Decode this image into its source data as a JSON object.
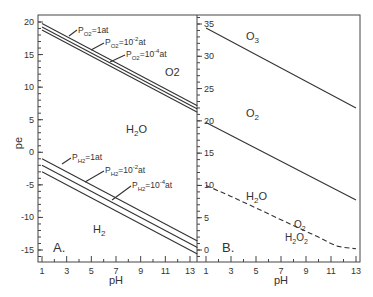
{
  "chart_data": [
    {
      "panel": "A.",
      "type": "line",
      "xlabel": "pH",
      "ylabel": "pe",
      "xlim": [
        0.7,
        13.6
      ],
      "ylim": [
        -16.5,
        21
      ],
      "xticks": [
        1,
        3,
        5,
        7,
        9,
        11,
        13
      ],
      "yticks": [
        20,
        15,
        10,
        5,
        0,
        -5,
        -10,
        -15
      ],
      "grid": false,
      "series": [
        {
          "name": "PO2=1at",
          "x": [
            1,
            13.6
          ],
          "y": [
            19.75,
            7.15
          ]
        },
        {
          "name": "PO2=10^-2at",
          "x": [
            1,
            13.6
          ],
          "y": [
            19.25,
            6.65
          ]
        },
        {
          "name": "PO2=10^-4at",
          "x": [
            1,
            13.6
          ],
          "y": [
            18.75,
            6.15
          ]
        },
        {
          "name": "PH2=1at",
          "x": [
            1,
            13.6
          ],
          "y": [
            -1,
            -13.6
          ]
        },
        {
          "name": "PH2=10^-2at",
          "x": [
            1,
            13.6
          ],
          "y": [
            -2,
            -14.6
          ]
        },
        {
          "name": "PH2=10^-4at",
          "x": [
            1,
            13.6
          ],
          "y": [
            -3,
            -15.6
          ]
        }
      ],
      "annotations": [
        "O2",
        "H2O",
        "H2",
        "A."
      ]
    },
    {
      "panel": "B.",
      "type": "line",
      "xlabel": "pH",
      "ylabel": "",
      "xlim": [
        0.7,
        13.3
      ],
      "ylim": [
        -1.5,
        37
      ],
      "xticks": [
        1,
        3,
        5,
        7,
        9,
        11,
        13
      ],
      "yticks": [
        35,
        30,
        25,
        20,
        15,
        10,
        5,
        0
      ],
      "grid": false,
      "series": [
        {
          "name": "O3/O2",
          "style": "solid",
          "x": [
            1,
            13
          ],
          "y": [
            34.4,
            22.0
          ]
        },
        {
          "name": "O2/H2O",
          "style": "solid",
          "x": [
            1,
            13
          ],
          "y": [
            19.75,
            7.75
          ]
        },
        {
          "name": "O2/H2O2 boundary",
          "style": "dashed",
          "x": [
            1,
            3,
            5,
            7,
            9,
            10,
            11,
            11.5,
            12,
            13
          ],
          "y": [
            10,
            8.3,
            6.5,
            4.7,
            2.9,
            2.0,
            1.0,
            0.6,
            0.4,
            0.2
          ]
        }
      ],
      "annotations": [
        "O3",
        "O2",
        "H2O",
        "O2",
        "H2O2",
        "B."
      ]
    }
  ],
  "labels": {
    "pe": "pe",
    "ph": "pH",
    "panel_a": "A.",
    "panel_b": "B.",
    "o2": "O2",
    "h2o": "H2O",
    "h2": "H2",
    "o3": "O3",
    "h2o2": "H2O2",
    "po2_1": "=1at",
    "po2_2": "=10",
    "po2_4": "=10",
    "ph2_1": "=1at",
    "ph2_2": "=10",
    "ph2_4": "=10",
    "exp_2": "-2",
    "exp_4": "-4",
    "at": "at",
    "p": "P",
    "sub_o2": "O2",
    "sub_h2": "H2"
  },
  "ticks": {
    "a_y": [
      "20",
      "15",
      "10",
      "5",
      "0",
      "-5",
      "-10",
      "-15"
    ],
    "b_y": [
      "35",
      "30",
      "25",
      "20",
      "15",
      "10",
      "5",
      "0"
    ],
    "x": [
      "1",
      "3",
      "5",
      "7",
      "9",
      "11",
      "13"
    ]
  }
}
